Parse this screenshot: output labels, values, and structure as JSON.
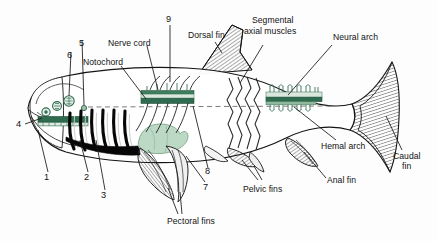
{
  "figure": {
    "type": "labeled-anatomical-diagram",
    "background_color": "#fdfdfd",
    "outline_color": "#141414",
    "accent_green": "#2f6b4f",
    "accent_pale_green": "#bcd9c5",
    "hatch_color": "#3a3a3a"
  },
  "labels": {
    "nerve_cord": "Nerve cord",
    "notochord": "Notochord",
    "dorsal_fin": "Dorsal fin",
    "segmental_axial_muscles_line1": "Segmental",
    "segmental_axial_muscles_line2": "axial muscles",
    "neural_arch": "Neural arch",
    "hemal_arch": "Hemal arch",
    "caudal_fin_line1": "Caudal",
    "caudal_fin_line2": "fin",
    "anal_fin": "Anal fin",
    "pelvic_fins": "Pelvic fins",
    "pectoral_fins": "Pectoral fins"
  },
  "numbers": {
    "n1": "1",
    "n2": "2",
    "n3": "3",
    "n4": "4",
    "n5": "5",
    "n6": "6",
    "n7": "7",
    "n8": "8",
    "n9": "9"
  }
}
